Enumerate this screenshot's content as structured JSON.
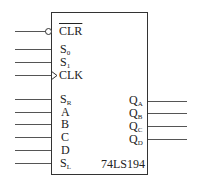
{
  "chip": {
    "name": "74LS194"
  },
  "inputs": {
    "clr": {
      "label": "CLR",
      "active_low": true
    },
    "s0": {
      "label": "S",
      "sub": "0"
    },
    "s1": {
      "label": "S",
      "sub": "1"
    },
    "clk": {
      "label": "CLK",
      "edge_triggered": true
    },
    "sr": {
      "label": "S",
      "sub": "R"
    },
    "a": {
      "label": "A"
    },
    "b": {
      "label": "B"
    },
    "c": {
      "label": "C"
    },
    "d": {
      "label": "D"
    },
    "sl": {
      "label": "S",
      "sub": "L"
    }
  },
  "outputs": {
    "qa": {
      "label": "Q",
      "sub": "A"
    },
    "qb": {
      "label": "Q",
      "sub": "B"
    },
    "qc": {
      "label": "Q",
      "sub": "C"
    },
    "qd": {
      "label": "Q",
      "sub": "D"
    }
  }
}
